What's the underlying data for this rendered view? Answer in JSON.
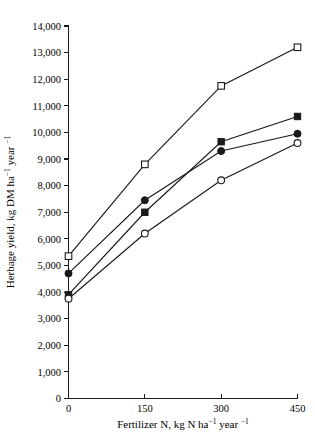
{
  "chart_data": {
    "type": "line",
    "title": "",
    "xlabel": "Fertilizer N, kg N ha⁻¹ year⁻¹",
    "ylabel": "Herbage yield, kg DM ha⁻¹ year⁻¹",
    "x": [
      0,
      150,
      300,
      450
    ],
    "xlim": [
      0,
      450
    ],
    "ylim": [
      0,
      14000
    ],
    "xticks": [
      "0",
      "150",
      "300",
      "450"
    ],
    "yticks": [
      "0",
      "1,000",
      "2,000",
      "3,000",
      "4,000",
      "5,000",
      "6,000",
      "7,000",
      "8,000",
      "9,000",
      "10,000",
      "11,000",
      "12,000",
      "13,000",
      "14,000"
    ],
    "ytick_values": [
      0,
      1000,
      2000,
      3000,
      4000,
      5000,
      6000,
      7000,
      8000,
      9000,
      10000,
      11000,
      12000,
      13000,
      14000
    ],
    "grid": false,
    "legend": "none",
    "series": [
      {
        "name": "open-square",
        "marker": "open-square",
        "values": [
          5350,
          8800,
          11750,
          13200
        ]
      },
      {
        "name": "filled-square",
        "marker": "filled-square",
        "values": [
          3900,
          7000,
          9650,
          10600
        ]
      },
      {
        "name": "filled-circle",
        "marker": "filled-circle",
        "values": [
          4700,
          7450,
          9300,
          9950
        ]
      },
      {
        "name": "open-circle",
        "marker": "open-circle",
        "values": [
          3750,
          6200,
          8200,
          9600
        ]
      }
    ]
  },
  "xlabel_parts": {
    "main": "Fertilizer N, kg N ha",
    "sup1": "−1",
    "mid": " year ",
    "sup2": "−1"
  },
  "ylabel_parts": {
    "main": "Herbage yield, kg DM ha",
    "sup1": "−1",
    "mid": " year ",
    "sup2": "−1"
  }
}
